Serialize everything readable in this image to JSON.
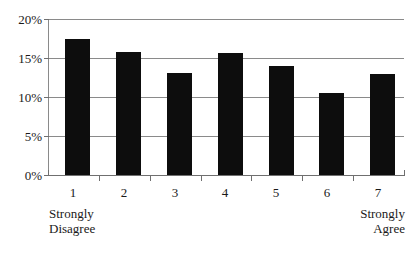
{
  "chart_data": {
    "type": "bar",
    "title": "",
    "subtitle": "",
    "xlabel": "",
    "ylabel": "",
    "categories": [
      "1",
      "2",
      "3",
      "4",
      "5",
      "6",
      "7"
    ],
    "values": [
      17.5,
      15.8,
      13.1,
      15.6,
      14.0,
      10.5,
      13.0
    ],
    "series": [
      {
        "name": "Response percentage",
        "values": [
          17.5,
          15.8,
          13.1,
          15.6,
          14.0,
          10.5,
          13.0
        ]
      }
    ],
    "ylim": [
      0,
      20
    ],
    "ytick_values": [
      0,
      5,
      10,
      15,
      20
    ],
    "ytick_labels": [
      "0%",
      "5%",
      "10%",
      "15%",
      "20%"
    ],
    "xtick_labels": [
      "1",
      "2",
      "3",
      "4",
      "5",
      "6",
      "7"
    ],
    "grid": true,
    "grid_axis": "y",
    "legend": false,
    "legend_position": "none",
    "bar_color": "#0d0d0d",
    "gridline_color": "#8a8a8a",
    "background_color": "#ffffff",
    "annotations": [
      {
        "text_lines": [
          "Strongly",
          "Disagree"
        ],
        "anchor": "left",
        "near_category": "1"
      },
      {
        "text_lines": [
          "Strongly",
          "Agree"
        ],
        "anchor": "right",
        "near_category": "7"
      }
    ]
  },
  "axis": {
    "y_labels": [
      "20%",
      "15%",
      "10%",
      "5%",
      "0%"
    ],
    "x_labels": [
      "1",
      "2",
      "3",
      "4",
      "5",
      "6",
      "7"
    ]
  },
  "anchors": {
    "left": {
      "line1": "Strongly",
      "line2": "Disagree"
    },
    "right": {
      "line1": "Strongly",
      "line2": "Agree"
    }
  }
}
